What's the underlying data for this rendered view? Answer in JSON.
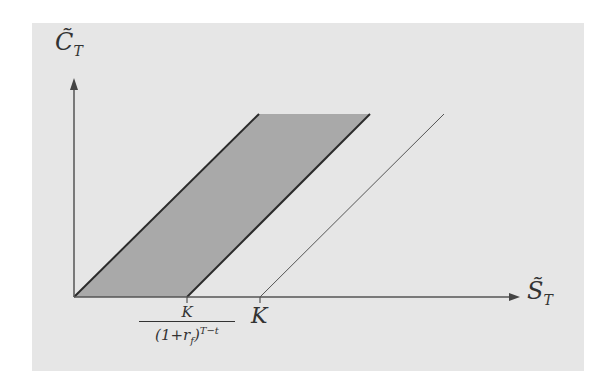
{
  "diagram": {
    "y_axis_label": "C̃",
    "y_axis_subscript": "T",
    "x_axis_label": "S̃",
    "x_axis_subscript": "T",
    "tick_labels": {
      "pv_strike": {
        "numerator": "K",
        "denominator_base": "(1+r",
        "denominator_sub": "f",
        "denominator_close": ")",
        "denominator_exp": "T−t"
      },
      "strike": "K"
    },
    "colors": {
      "background": "#e6e6e6",
      "shaded_region": "#9e9e9e",
      "lines": "#2b2b2b",
      "thin_line": "#555555"
    },
    "elements": [
      {
        "name": "lower-bound-line",
        "description": "payoff line from origin"
      },
      {
        "name": "shaded-region",
        "description": "band between line from origin and line from K/(1+r_f)^(T-t)"
      },
      {
        "name": "upper-line-pv-strike",
        "description": "line starting at K/(1+r_f)^(T-t)"
      },
      {
        "name": "thin-line-strike",
        "description": "thin line starting at K"
      }
    ]
  }
}
